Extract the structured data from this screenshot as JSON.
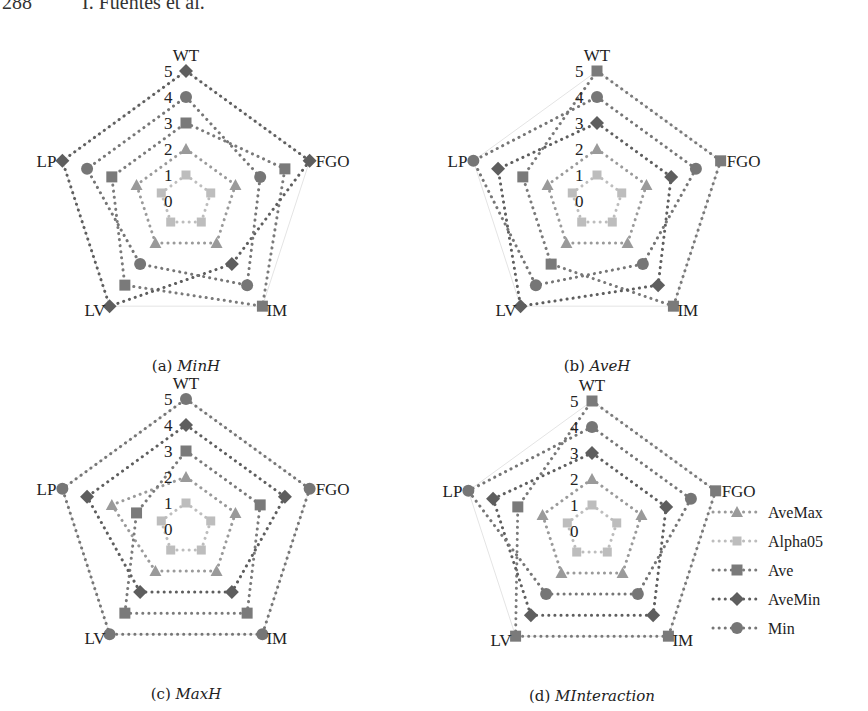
{
  "page_header": {
    "page_number": "288",
    "authors": "I. Fuentes et al."
  },
  "chart_data": [
    {
      "type": "radar",
      "id": "a",
      "title": "(a) MinH",
      "caption_prefix": "(a)",
      "caption_name": "MinH",
      "axes": [
        "WT",
        "FGO",
        "IM",
        "LV",
        "LP"
      ],
      "rlim": [
        0,
        5
      ],
      "ticks": [
        "0",
        "1",
        "2",
        "3",
        "4",
        "5"
      ],
      "series": [
        {
          "name": "AveMax",
          "values": [
            2,
            2,
            2,
            2,
            2
          ]
        },
        {
          "name": "Alpha05",
          "values": [
            1,
            1,
            1,
            1,
            1
          ]
        },
        {
          "name": "Ave",
          "values": [
            3,
            4,
            5,
            4,
            3
          ]
        },
        {
          "name": "AveMin",
          "values": [
            5,
            5,
            3,
            5,
            5
          ]
        },
        {
          "name": "Min",
          "values": [
            4,
            3,
            4,
            3,
            4
          ]
        }
      ]
    },
    {
      "type": "radar",
      "id": "b",
      "title": "(b) AveH",
      "caption_prefix": "(b)",
      "caption_name": "AveH",
      "axes": [
        "WT",
        "FGO",
        "IM",
        "LV",
        "LP"
      ],
      "rlim": [
        0,
        5
      ],
      "ticks": [
        "0",
        "1",
        "2",
        "3",
        "4",
        "5"
      ],
      "series": [
        {
          "name": "AveMax",
          "values": [
            2,
            2,
            2,
            2,
            2
          ]
        },
        {
          "name": "Alpha05",
          "values": [
            1,
            1,
            1,
            1,
            1
          ]
        },
        {
          "name": "Ave",
          "values": [
            5,
            5,
            5,
            3,
            3
          ]
        },
        {
          "name": "AveMin",
          "values": [
            3,
            3,
            4,
            5,
            4
          ]
        },
        {
          "name": "Min",
          "values": [
            4,
            4,
            3,
            4,
            5
          ]
        }
      ]
    },
    {
      "type": "radar",
      "id": "c",
      "title": "(c) MaxH",
      "caption_prefix": "(c)",
      "caption_name": "MaxH",
      "axes": [
        "WT",
        "FGO",
        "IM",
        "LV",
        "LP"
      ],
      "rlim": [
        0,
        5
      ],
      "ticks": [
        "0",
        "1",
        "2",
        "3",
        "4",
        "5"
      ],
      "series": [
        {
          "name": "AveMax",
          "values": [
            2,
            2,
            2,
            2,
            3
          ]
        },
        {
          "name": "Alpha05",
          "values": [
            1,
            1,
            1,
            1,
            1
          ]
        },
        {
          "name": "Ave",
          "values": [
            3,
            3,
            4,
            4,
            2
          ]
        },
        {
          "name": "AveMin",
          "values": [
            4,
            4,
            3,
            3,
            4
          ]
        },
        {
          "name": "Min",
          "values": [
            5,
            5,
            5,
            5,
            5
          ]
        }
      ]
    },
    {
      "type": "radar",
      "id": "d",
      "title": "(d) MInteraction",
      "caption_prefix": "(d)",
      "caption_name": "MInteraction",
      "axes": [
        "WT",
        "FGO",
        "IM",
        "LV",
        "LP"
      ],
      "rlim": [
        0,
        5
      ],
      "ticks": [
        "0",
        "1",
        "2",
        "3",
        "4",
        "5"
      ],
      "series": [
        {
          "name": "AveMax",
          "values": [
            2,
            2,
            2,
            2,
            2
          ]
        },
        {
          "name": "Alpha05",
          "values": [
            1,
            1,
            1,
            1,
            1
          ]
        },
        {
          "name": "Ave",
          "values": [
            5,
            5,
            5,
            5,
            3
          ]
        },
        {
          "name": "AveMin",
          "values": [
            3,
            3,
            4,
            4,
            4
          ]
        },
        {
          "name": "Min",
          "values": [
            4,
            4,
            3,
            3,
            5
          ]
        }
      ]
    }
  ],
  "legend": {
    "position": "right of panel (d)",
    "items": [
      {
        "name": "AveMax",
        "marker": "triangle",
        "color": "#9a9a9a"
      },
      {
        "name": "Alpha05",
        "marker": "small-square",
        "color": "#bdbdbd"
      },
      {
        "name": "Ave",
        "marker": "square",
        "color": "#7a7a7a"
      },
      {
        "name": "AveMin",
        "marker": "diamond",
        "color": "#5e5e5e"
      },
      {
        "name": "Min",
        "marker": "circle",
        "color": "#767676"
      }
    ]
  },
  "styles": {
    "grid_color": "#e4e4e4",
    "series_colors": {
      "AveMax": "#9a9a9a",
      "Alpha05": "#bdbdbd",
      "Ave": "#7a7a7a",
      "AveMin": "#5e5e5e",
      "Min": "#767676"
    }
  }
}
